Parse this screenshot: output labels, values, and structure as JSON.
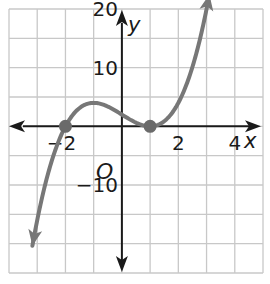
{
  "chart_data": {
    "type": "line",
    "title": "",
    "xlabel": "x",
    "ylabel": "y",
    "origin_label": "O",
    "xlim": [
      -4,
      5
    ],
    "ylim": [
      -25,
      20
    ],
    "grid": true,
    "grid_step_x": 1,
    "grid_step_y": 5,
    "x_tick_labels": [
      {
        "value": -2,
        "label": "−2"
      },
      {
        "value": 2,
        "label": "2"
      },
      {
        "value": 4,
        "label": "4"
      }
    ],
    "y_tick_labels": [
      {
        "value": 20,
        "label": "20"
      },
      {
        "value": 10,
        "label": "10"
      },
      {
        "value": -10,
        "label": "−10"
      }
    ],
    "series": [
      {
        "name": "f(x) = (x + 2)(x − 1)^2",
        "x_range": [
          -3.17,
          3.1
        ],
        "points": [
          [
            -3.17,
            -20.0
          ],
          [
            -3.0,
            -16.0
          ],
          [
            -2.75,
            -13.4
          ],
          [
            -2.5,
            -6.1
          ],
          [
            -2.0,
            0.0
          ],
          [
            -1.5,
            3.1
          ],
          [
            -1.0,
            4.0
          ],
          [
            -0.5,
            3.4
          ],
          [
            0.0,
            2.0
          ],
          [
            0.5,
            0.6
          ],
          [
            1.0,
            0.0
          ],
          [
            1.5,
            0.9
          ],
          [
            2.0,
            4.0
          ],
          [
            2.5,
            10.1
          ],
          [
            3.0,
            20.0
          ],
          [
            3.1,
            22.1
          ]
        ],
        "color": "#777777"
      }
    ],
    "marked_points": [
      {
        "x": -2,
        "y": 0,
        "label": "zero at x = -2"
      },
      {
        "x": 1,
        "y": 0,
        "label": "zero at x = 1"
      }
    ],
    "colors": {
      "grid": "#c8c8c8",
      "axes": "#1a1a1a",
      "curve": "#777777",
      "points": "#6a6a6a"
    }
  }
}
